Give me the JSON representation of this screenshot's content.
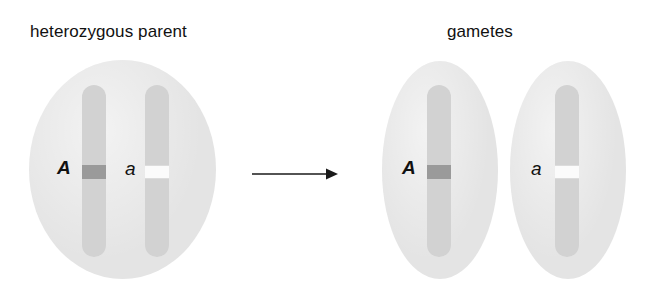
{
  "diagram": {
    "labels": {
      "parent": "heterozygous parent",
      "gametes": "gametes"
    },
    "parent_cell": {
      "name": "heterozygous parent cell",
      "chromosomes": [
        {
          "allele": "A",
          "allele_type": "dominant",
          "band_color": "#9a9a9a"
        },
        {
          "allele": "a",
          "allele_type": "recessive",
          "band_color": "#fbfbfb"
        }
      ]
    },
    "gametes": [
      {
        "allele": "A",
        "allele_type": "dominant",
        "band_color": "#9a9a9a"
      },
      {
        "allele": "a",
        "allele_type": "recessive",
        "band_color": "#fbfbfb"
      }
    ],
    "arrow": {
      "direction": "right",
      "meaning": "segregation into gametes"
    },
    "colors": {
      "background": "#ffffff",
      "cytoplasm": "#e4e4e4",
      "chromosome": "#d2d2d2",
      "dominant_band": "#9a9a9a",
      "recessive_band": "#fbfbfb",
      "text": "#111111",
      "arrow": "#1a1a1a"
    }
  }
}
